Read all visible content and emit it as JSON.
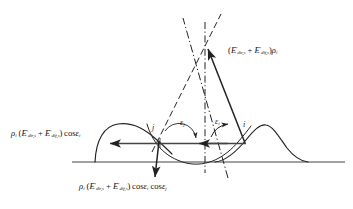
{
  "figure": {
    "type": "ray-geometry-diagram",
    "background_color": "#ffffff",
    "stroke_color": "#222222",
    "baseline": {
      "y": 162,
      "x_start": 72,
      "x_end": 345
    }
  },
  "labels": {
    "reflected_up": {
      "text_parts": [
        "(",
        "E",
        "dir,s",
        "+",
        "E",
        "dif,s",
        ")",
        "ρ",
        "i"
      ],
      "plain": "(E'dir,s + E'dif,s)ρi",
      "x": 228,
      "y": 49
    },
    "left_horizontal": {
      "plain": "ρi (E'dir,s + E'dif,s) cosεi",
      "x": 12,
      "y": 131
    },
    "bottom": {
      "plain": "ρi (E'dir,s + E'dif,s) cosεi cosεj",
      "x": 80,
      "y": 183
    }
  },
  "points": [
    {
      "name": "j",
      "label": "j",
      "x": 160,
      "y": 143,
      "label_x": 153,
      "label_y": 126
    },
    {
      "name": "i",
      "label": "i",
      "x": 245,
      "y": 143,
      "label_x": 243,
      "label_y": 123
    }
  ],
  "angles": [
    {
      "name": "epsilon-j",
      "label": "ε",
      "sub": "j",
      "x": 180,
      "y": 121
    },
    {
      "name": "epsilon-i",
      "label": "ε",
      "sub": "i",
      "x": 215,
      "y": 120
    }
  ],
  "symbols": {
    "rho": "ρ",
    "epsilon": "ε",
    "E": "E",
    "cos": "cos",
    "prime": "′",
    "sub_dir": "dir,s",
    "sub_dif": "dif,s",
    "sub_i": "i",
    "sub_j": "j"
  },
  "geometry": {
    "apex": {
      "x": 205,
      "y": 45
    },
    "normal_line": {
      "x": 205,
      "y_top": 22,
      "y_bottom": 172,
      "style": "dash-dot"
    },
    "ray_i_to_apex": {
      "x1": 245,
      "y1": 143,
      "x2": 207,
      "y2": 47
    },
    "arrow_left_long": {
      "x1": 228,
      "y1": 143,
      "x2": 108,
      "y2": 143
    },
    "arrow_left_short": {
      "x1": 245,
      "y1": 143,
      "x2": 198,
      "y2": 143
    },
    "arrow_down_left": {
      "x1": 160,
      "y1": 143,
      "x2": 155,
      "y2": 176
    }
  }
}
